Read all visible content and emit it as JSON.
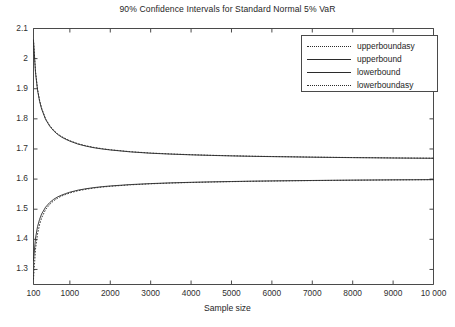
{
  "chart_data": {
    "type": "line",
    "title": "90% Confidence Intervals for Standard Normal 5% VaR",
    "xlabel": "Sample size",
    "ylabel": "",
    "xlim": [
      100,
      10000
    ],
    "ylim": [
      1.25,
      2.1
    ],
    "grid": false,
    "legend_position": "top-right",
    "xticks": [
      100,
      1000,
      2000,
      3000,
      4000,
      5000,
      6000,
      7000,
      8000,
      9000,
      10000
    ],
    "xtick_labels": [
      "100",
      "1000",
      "2000",
      "3000",
      "4000",
      "5000",
      "6000",
      "7000",
      "8000",
      "9000",
      "10 000"
    ],
    "yticks": [
      1.3,
      1.4,
      1.5,
      1.6,
      1.7,
      1.8,
      1.9,
      2.0,
      2.1
    ],
    "ytick_labels": [
      "1.3",
      "1.4",
      "1.5",
      "1.6",
      "1.7",
      "1.8",
      "1.9",
      "2",
      "2.1"
    ],
    "x": [
      100,
      150,
      200,
      250,
      300,
      400,
      500,
      600,
      700,
      800,
      900,
      1000,
      1200,
      1400,
      1600,
      1800,
      2000,
      2500,
      3000,
      3500,
      4000,
      4500,
      5000,
      5500,
      6000,
      6500,
      7000,
      7500,
      8000,
      8500,
      9000,
      9500,
      10000
    ],
    "series": [
      {
        "name": "upperboundasy",
        "style": "dotted",
        "color": "#2b2b2b",
        "values": [
          2.062,
          1.958,
          1.899,
          1.862,
          1.836,
          1.8,
          1.778,
          1.762,
          1.75,
          1.741,
          1.734,
          1.7275,
          1.7175,
          1.7105,
          1.705,
          1.701,
          1.6975,
          1.691,
          1.6865,
          1.6835,
          1.681,
          1.679,
          1.6775,
          1.676,
          1.675,
          1.674,
          1.673,
          1.6722,
          1.6715,
          1.671,
          1.6703,
          1.6698,
          1.6694
        ]
      },
      {
        "name": "upperbound",
        "style": "solid",
        "color": "#2b2b2b",
        "values": [
          2.058,
          1.953,
          1.895,
          1.859,
          1.833,
          1.798,
          1.776,
          1.76,
          1.748,
          1.739,
          1.732,
          1.726,
          1.7162,
          1.7094,
          1.704,
          1.7,
          1.6967,
          1.6903,
          1.6859,
          1.6829,
          1.6805,
          1.6786,
          1.677,
          1.6756,
          1.6746,
          1.6737,
          1.6727,
          1.6719,
          1.6712,
          1.6707,
          1.67,
          1.6695,
          1.6691
        ]
      },
      {
        "name": "lowerbound",
        "style": "solid",
        "color": "#2b2b2b",
        "values": [
          1.33,
          1.404,
          1.442,
          1.466,
          1.484,
          1.507,
          1.522,
          1.533,
          1.541,
          1.547,
          1.552,
          1.5565,
          1.5632,
          1.568,
          1.5718,
          1.5748,
          1.5772,
          1.5818,
          1.5851,
          1.5875,
          1.5893,
          1.5908,
          1.592,
          1.5931,
          1.594,
          1.5947,
          1.5954,
          1.596,
          1.5966,
          1.597,
          1.5975,
          1.5979,
          1.5983
        ]
      },
      {
        "name": "lowerboundasy",
        "style": "dotted",
        "color": "#2b2b2b",
        "values": [
          1.268,
          1.368,
          1.418,
          1.449,
          1.471,
          1.499,
          1.516,
          1.528,
          1.537,
          1.544,
          1.549,
          1.554,
          1.5612,
          1.5663,
          1.5703,
          1.5735,
          1.576,
          1.5809,
          1.5843,
          1.5868,
          1.5887,
          1.5902,
          1.5915,
          1.5926,
          1.5935,
          1.5943,
          1.595,
          1.5956,
          1.5962,
          1.5967,
          1.5972,
          1.5976,
          1.598
        ]
      }
    ]
  },
  "legend": {
    "items": [
      {
        "label": "upperboundasy",
        "style": "dotted"
      },
      {
        "label": "upperbound",
        "style": "solid"
      },
      {
        "label": "lowerbound",
        "style": "solid"
      },
      {
        "label": "lowerboundasy",
        "style": "dotted"
      }
    ]
  },
  "colors": {
    "line": "#2b2b2b",
    "axis": "#4a4a4a",
    "text": "#262626",
    "background": "#ffffff"
  }
}
